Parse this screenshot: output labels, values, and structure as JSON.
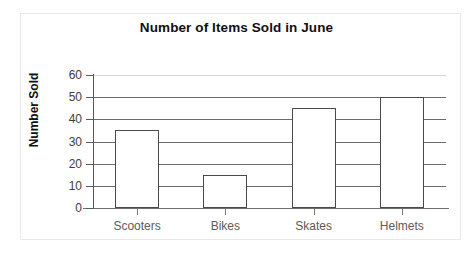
{
  "chart_data": {
    "type": "bar",
    "title": "Number of Items Sold in June",
    "xlabel": "",
    "ylabel": "Number Sold",
    "categories": [
      "Scooters",
      "Bikes",
      "Skates",
      "Helmets"
    ],
    "values": [
      35,
      15,
      45,
      50
    ],
    "ylim": [
      0,
      60
    ],
    "ytick_labels": [
      "0",
      "10",
      "20",
      "30",
      "40",
      "50",
      "60"
    ],
    "ytick_values": [
      0,
      10,
      20,
      30,
      40,
      50,
      60
    ],
    "grid": "horizontal",
    "legend": "none",
    "bar_fill_color": "#ffffff",
    "bar_edge_color": "#4a4a4a",
    "gridline_color": "#6b6b6b",
    "axis_color": "#5a5a5a",
    "background_color": "#ffffff"
  }
}
